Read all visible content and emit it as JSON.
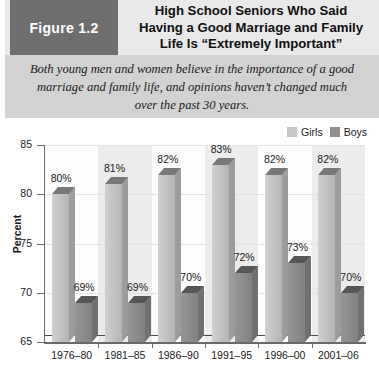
{
  "figure_tag": "Figure 1.2",
  "title_lines": [
    "High School Seniors Who Said",
    "Having a Good Marriage and Family",
    "Life Is “Extremely Important”"
  ],
  "caption_lines": [
    "Both young men and women believe in the importance of a good",
    "marriage and family life, and opinions haven’t changed much",
    "over the past 30 years."
  ],
  "legend": [
    {
      "label": "Girls",
      "color": "#c8c8c8"
    },
    {
      "label": "Boys",
      "color": "#8f8f8f"
    }
  ],
  "colors": {
    "figure_box_bg": "#6e6e6e",
    "header_bg": "#e9e9e9",
    "caption_bg": "#d2d2d2",
    "girls": "#c8c8c8",
    "boys": "#8f8f8f",
    "axis": "#6a6a6a",
    "band": "#ececec",
    "grid": "#e2e2e2",
    "floor": "#4a4a4a"
  },
  "chart_data": {
    "type": "bar",
    "title": "High School Seniors Who Said Having a Good Marriage and Family Life Is “Extremely Important”",
    "xlabel": "",
    "ylabel": "Percent",
    "ylim": [
      65,
      85
    ],
    "yticks": [
      65,
      70,
      75,
      80,
      85
    ],
    "ytick_labels": [
      "65",
      "70",
      "75",
      "80",
      "85"
    ],
    "grid": true,
    "legend_position": "top-right",
    "categories": [
      "1976–80",
      "1981–85",
      "1986–90",
      "1991–95",
      "1996–00",
      "2001–06"
    ],
    "series": [
      {
        "name": "Girls",
        "color": "#c8c8c8",
        "values": [
          80,
          81,
          82,
          83,
          82,
          82
        ],
        "data_labels": [
          "80%",
          "81%",
          "82%",
          "83%",
          "82%",
          "82%"
        ]
      },
      {
        "name": "Boys",
        "color": "#8f8f8f",
        "values": [
          69,
          69,
          70,
          72,
          73,
          70
        ],
        "data_labels": [
          "69%",
          "69%",
          "70%",
          "72%",
          "73%",
          "70%"
        ]
      }
    ]
  }
}
